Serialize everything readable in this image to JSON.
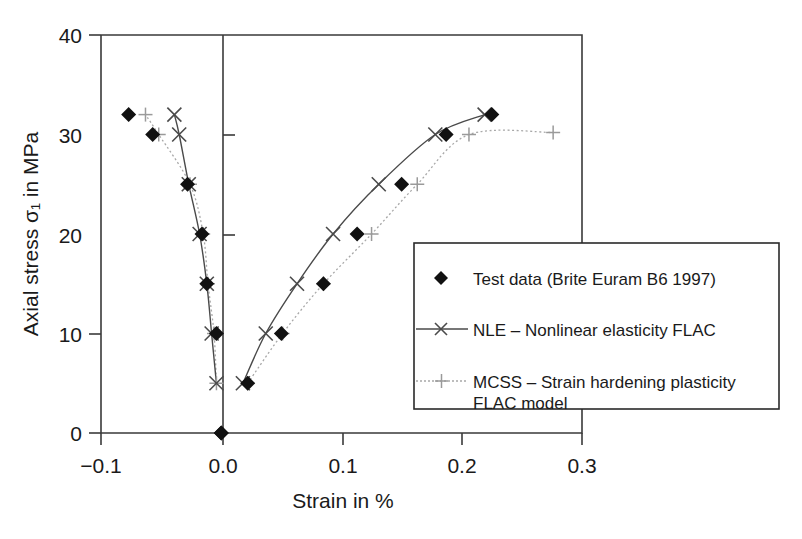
{
  "chart_data": {
    "type": "line",
    "title": "",
    "xlabel": "Strain in %",
    "ylabel": "Axial stress σ₁ in MPa",
    "xlim": [
      -0.1,
      0.3
    ],
    "ylim": [
      0,
      40
    ],
    "xticks": [
      -0.1,
      0.0,
      0.1,
      0.2,
      0.3
    ],
    "xticklabels": [
      "−0.1",
      "0.0",
      "0.1",
      "0.2",
      "0.3"
    ],
    "yticks": [
      0,
      10,
      20,
      30,
      40
    ],
    "yticklabels": [
      "0",
      "10",
      "20",
      "30",
      "40"
    ],
    "grid": false,
    "legend_position": "lower right",
    "series": [
      {
        "name": "Test data (Brite Euram B6 1997)",
        "key": "test-data",
        "marker": "diamond",
        "line": "none",
        "color": "#111111",
        "points_lateral": [
          [
            0.0,
            0.0
          ],
          [
            -0.004,
            10.0
          ],
          [
            -0.012,
            15.0
          ],
          [
            -0.016,
            20.0
          ],
          [
            -0.028,
            25.0
          ],
          [
            -0.057,
            30.0
          ],
          [
            -0.077,
            32.0
          ]
        ],
        "points_axial": [
          [
            0.0,
            0.0
          ],
          [
            0.022,
            5.0
          ],
          [
            0.05,
            10.0
          ],
          [
            0.085,
            15.0
          ],
          [
            0.113,
            20.0
          ],
          [
            0.15,
            25.0
          ],
          [
            0.187,
            30.0
          ],
          [
            0.225,
            32.0
          ]
        ]
      },
      {
        "name": "NLE – Nonlinear elasticity FLAC",
        "key": "nle",
        "marker": "cross",
        "line": "solid",
        "color": "#4a4a4a",
        "points_lateral": [
          [
            -0.004,
            5.0
          ],
          [
            -0.008,
            10.0
          ],
          [
            -0.012,
            15.0
          ],
          [
            -0.018,
            20.0
          ],
          [
            -0.027,
            25.0
          ],
          [
            -0.035,
            30.0
          ],
          [
            -0.039,
            32.0
          ]
        ],
        "points_axial": [
          [
            0.018,
            5.0
          ],
          [
            0.037,
            10.0
          ],
          [
            0.063,
            15.0
          ],
          [
            0.093,
            20.0
          ],
          [
            0.131,
            25.0
          ],
          [
            0.178,
            30.0
          ],
          [
            0.219,
            32.0
          ]
        ]
      },
      {
        "name": "MCSS – Strain hardening plasticity FLAC model",
        "key": "mcss",
        "marker": "plus",
        "line": "dotted",
        "color": "#9a9a9a",
        "points_lateral": [
          [
            -0.004,
            5.0
          ],
          [
            -0.006,
            10.0
          ],
          [
            -0.011,
            15.0
          ],
          [
            -0.015,
            20.0
          ],
          [
            -0.026,
            25.0
          ],
          [
            -0.052,
            30.0
          ],
          [
            -0.063,
            32.0
          ]
        ],
        "points_axial": [
          [
            0.022,
            5.0
          ],
          [
            0.051,
            10.0
          ],
          [
            0.085,
            15.0
          ],
          [
            0.125,
            20.0
          ],
          [
            0.163,
            25.0
          ],
          [
            0.206,
            30.0
          ],
          [
            0.276,
            30.2
          ]
        ]
      }
    ],
    "legend_entries": [
      {
        "label": "Test data (Brite Euram B6 1997)",
        "marker": "diamond",
        "line": "none",
        "label2": ""
      },
      {
        "label": "NLE – Nonlinear elasticity FLAC",
        "marker": "cross",
        "line": "solid",
        "label2": ""
      },
      {
        "label": "MCSS – Strain hardening plasticity",
        "marker": "plus",
        "line": "dotted",
        "label2": "FLAC model"
      }
    ]
  }
}
